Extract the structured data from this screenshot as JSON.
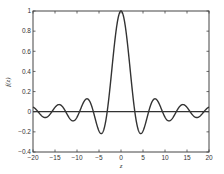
{
  "chart_data": {
    "type": "line",
    "title": "",
    "xlabel": "z",
    "ylabel": "f(z)",
    "xlim": [
      -20,
      20
    ],
    "ylim": [
      -0.4,
      1
    ],
    "grid": false,
    "legend": null,
    "x_ticks": [
      -20,
      -15,
      -10,
      -5,
      0,
      5,
      10,
      15,
      20
    ],
    "x_tick_labels": [
      "-20",
      "-15",
      "-10",
      "-5",
      "0",
      "5",
      "10",
      "15",
      "20"
    ],
    "y_ticks": [
      -0.4,
      -0.2,
      0,
      0.2,
      0.4,
      0.6,
      0.8,
      1
    ],
    "y_tick_labels": [
      "-0.4",
      "-0.2",
      "0",
      "0.2",
      "0.4",
      "0.6",
      "0.8",
      "1"
    ],
    "function": "sin(z)/z",
    "series": [
      {
        "name": "f(z)",
        "color": "#333333",
        "x": [
          -20,
          -17.2,
          -14.07,
          -10.9,
          -7.73,
          -4.49,
          -3.14,
          0,
          3.14,
          4.49,
          7.73,
          10.9,
          14.07,
          17.2,
          20
        ],
        "values": [
          0.046,
          -0.058,
          0.071,
          -0.091,
          0.128,
          -0.217,
          0,
          1,
          0,
          -0.217,
          0.128,
          -0.091,
          0.071,
          -0.058,
          0.046
        ]
      },
      {
        "name": "zero-line",
        "color": "#333333",
        "x": [
          -20,
          20
        ],
        "values": [
          0,
          0
        ]
      }
    ]
  }
}
